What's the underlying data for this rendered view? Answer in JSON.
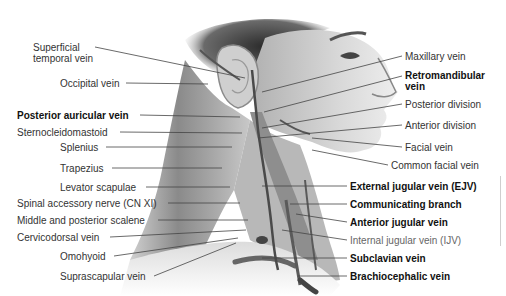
{
  "figure": {
    "labels_left": [
      {
        "id": "superficial-temporal-vein",
        "text": "Superficial\ntemporal vein",
        "line1": "Superficial",
        "line2": "temporal vein",
        "bold": false,
        "x": 33,
        "y": 43
      },
      {
        "id": "occipital-vein",
        "text": "Occipital vein",
        "bold": false,
        "x": 60,
        "y": 78
      },
      {
        "id": "posterior-auricular-vein",
        "text": "Posterior auricular vein",
        "bold": true,
        "x": 17,
        "y": 110
      },
      {
        "id": "sternocleidomastoid",
        "text": "Sternocleidomastoid",
        "bold": false,
        "x": 17,
        "y": 127
      },
      {
        "id": "splenius",
        "text": "Splenius",
        "bold": false,
        "x": 60,
        "y": 142
      },
      {
        "id": "trapezius",
        "text": "Trapezius",
        "bold": false,
        "x": 60,
        "y": 163
      },
      {
        "id": "levator-scapulae",
        "text": "Levator scapulae",
        "bold": false,
        "x": 60,
        "y": 182
      },
      {
        "id": "spinal-accessory-nerve",
        "text": "Spinal accessory nerve (CN XI)",
        "bold": false,
        "x": 17,
        "y": 198
      },
      {
        "id": "middle-posterior-scalene",
        "text": "Middle and posterior scalene",
        "bold": false,
        "x": 17,
        "y": 215
      },
      {
        "id": "cervicodorsal-vein",
        "text": "Cervicodorsal vein",
        "bold": false,
        "x": 17,
        "y": 232
      },
      {
        "id": "omohyoid",
        "text": "Omohyoid",
        "bold": false,
        "x": 60,
        "y": 251
      },
      {
        "id": "suprascapular-vein",
        "text": "Suprascapular vein",
        "bold": false,
        "x": 60,
        "y": 271
      }
    ],
    "labels_right": [
      {
        "id": "maxillary-vein",
        "text": "Maxillary vein",
        "bold": false,
        "x": 405,
        "y": 51
      },
      {
        "id": "retromandibular-vein",
        "text": "Retromandibular\nvein",
        "line1": "Retromandibular",
        "line2": "vein",
        "bold": true,
        "x": 405,
        "y": 70
      },
      {
        "id": "posterior-division",
        "text": "Posterior division",
        "bold": false,
        "x": 405,
        "y": 99
      },
      {
        "id": "anterior-division",
        "text": "Anterior division",
        "bold": false,
        "x": 405,
        "y": 120
      },
      {
        "id": "facial-vein",
        "text": "Facial vein",
        "bold": false,
        "x": 405,
        "y": 142
      },
      {
        "id": "common-facial-vein",
        "text": "Common facial vein",
        "bold": false,
        "x": 391,
        "y": 160
      },
      {
        "id": "external-jugular-vein",
        "text": "External jugular vein (EJV)",
        "bold": true,
        "x": 350,
        "y": 181
      },
      {
        "id": "communicating-branch",
        "text": "Communicating branch",
        "bold": true,
        "x": 350,
        "y": 199
      },
      {
        "id": "anterior-jugular-vein",
        "text": "Anterior jugular vein",
        "bold": true,
        "x": 350,
        "y": 217
      },
      {
        "id": "internal-jugular-vein",
        "text": "Internal jugular vein (IJV)",
        "bold": false,
        "light": true,
        "x": 350,
        "y": 235
      },
      {
        "id": "subclavian-vein",
        "text": "Subclavian vein",
        "bold": true,
        "x": 350,
        "y": 253
      },
      {
        "id": "brachiocephalic-vein",
        "text": "Brachiocephalic vein",
        "bold": true,
        "x": 350,
        "y": 271
      }
    ],
    "colors": {
      "background": "#ffffff",
      "label_text": "#333333",
      "bold_text": "#111111",
      "leader_line": "#444444",
      "skin_light": "#e6e6e6",
      "skin_mid": "#bdbdbd",
      "hair_dark": "#3a3a3a",
      "muscle": "#8f8f8f",
      "vein": "#555555"
    }
  }
}
